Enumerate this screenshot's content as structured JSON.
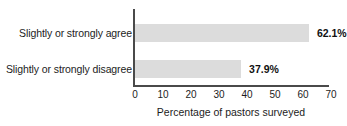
{
  "chart_data": {
    "type": "bar",
    "orientation": "horizontal",
    "title": "",
    "subtitle": "",
    "categories": [
      "Slightly or strongly agree",
      "Slightly or strongly disagree"
    ],
    "values": [
      62.1,
      37.9
    ],
    "value_labels": [
      "62.1%",
      "37.9%"
    ],
    "series": [
      {
        "name": "Percentage of pastors surveyed",
        "values": [
          62.1,
          37.9
        ]
      }
    ],
    "xlabel": "Percentage of pastors surveyed",
    "ylabel": "",
    "xlim": [
      0,
      70
    ],
    "ylim": [
      0,
      2
    ],
    "xticks": [
      0,
      10,
      20,
      30,
      40,
      50,
      60,
      70
    ],
    "xtick_labels": [
      "0",
      "10",
      "20",
      "30",
      "40",
      "50",
      "60",
      "70"
    ],
    "grid": false,
    "legend": false,
    "legend_position": "none",
    "colors": {
      "bar_fill": "#dcdcdc",
      "axis": "#4a4a4a",
      "text": "#1c1c1c",
      "value_text": "#111111",
      "background": "#ffffff"
    }
  }
}
